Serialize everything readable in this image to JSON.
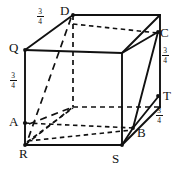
{
  "figure": {
    "type": "geometric-diagram",
    "stroke_color": "#111111",
    "background_color": "#ffffff",
    "width": 182,
    "height": 173
  },
  "vertex_labels": [
    {
      "id": "D",
      "text": "D",
      "x": 60,
      "y": 4
    },
    {
      "id": "C",
      "text": "C",
      "x": 160,
      "y": 26
    },
    {
      "id": "Q",
      "text": "Q",
      "x": 9,
      "y": 41
    },
    {
      "id": "T",
      "text": "T",
      "x": 163,
      "y": 89
    },
    {
      "id": "A",
      "text": "A",
      "x": 9,
      "y": 115
    },
    {
      "id": "B",
      "text": "B",
      "x": 137,
      "y": 126
    },
    {
      "id": "R",
      "text": "R",
      "x": 19,
      "y": 147
    },
    {
      "id": "S",
      "text": "S",
      "x": 112,
      "y": 152
    }
  ],
  "edge_measures": [
    {
      "id": "top-left-edge",
      "numerator": "3",
      "denominator": "4",
      "x": 33,
      "y": 8
    },
    {
      "id": "right-upper-edge",
      "numerator": "3",
      "denominator": "4",
      "x": 158,
      "y": 47
    },
    {
      "id": "left-edge",
      "numerator": "3",
      "denominator": "4",
      "x": 6,
      "y": 72
    },
    {
      "id": "right-lower-edge",
      "numerator": "3",
      "denominator": "4",
      "x": 152,
      "y": 107
    }
  ],
  "geometry": {
    "cube": {
      "front_top_left": {
        "x": 25,
        "y": 50
      },
      "front_top_right": {
        "x": 122,
        "y": 53
      },
      "front_bot_left": {
        "x": 25,
        "y": 145
      },
      "front_bot_right": {
        "x": 122,
        "y": 145
      },
      "back_top_left": {
        "x": 73,
        "y": 15
      },
      "back_top_right": {
        "x": 160,
        "y": 15
      },
      "back_bot_left": {
        "x": 73,
        "y": 107
      },
      "back_bot_right": {
        "x": 160,
        "y": 107
      }
    },
    "marked_points": {
      "D": {
        "x": 73,
        "y": 15
      },
      "C": {
        "x": 158,
        "y": 32
      },
      "Q": {
        "x": 25,
        "y": 50
      },
      "T": {
        "x": 158,
        "y": 96
      },
      "A": {
        "x": 25,
        "y": 123
      },
      "B": {
        "x": 134,
        "y": 128
      },
      "R": {
        "x": 25,
        "y": 145
      },
      "S": {
        "x": 122,
        "y": 145
      }
    }
  }
}
